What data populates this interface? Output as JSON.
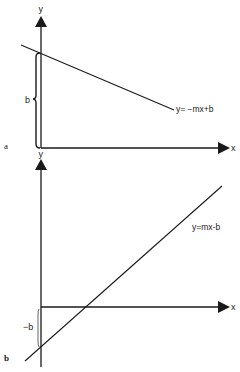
{
  "diagram": {
    "panels": [
      {
        "id": "a",
        "panel_label": "a",
        "x_axis_label": "x",
        "y_axis_label": "y",
        "equation": "y= −mx+b",
        "intercept_label": "b",
        "slope_sign": "negative",
        "intercept_sign": "positive"
      },
      {
        "id": "b",
        "panel_label": "b",
        "x_axis_label": "x",
        "y_axis_label": "y",
        "equation": "y=mx-b",
        "intercept_label": "−b",
        "slope_sign": "positive",
        "intercept_sign": "negative"
      }
    ],
    "colors": {
      "ink": "#1a1a1a",
      "background": "#ffffff"
    }
  }
}
